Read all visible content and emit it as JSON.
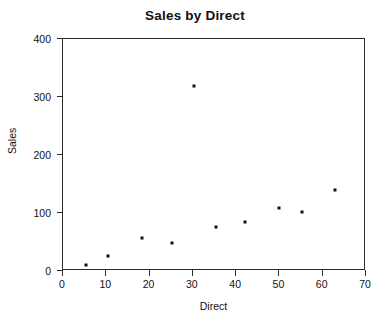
{
  "chart_data": {
    "type": "scatter",
    "title": "Sales by Direct",
    "xlabel": "Direct",
    "ylabel": "Sales",
    "xlim": [
      0,
      70
    ],
    "ylim": [
      0,
      400
    ],
    "xticks": [
      0,
      10,
      20,
      30,
      40,
      50,
      60,
      70
    ],
    "yticks": [
      0,
      100,
      200,
      300,
      400
    ],
    "xtick_labels": [
      "0",
      "10",
      "20",
      "30",
      "40",
      "50",
      "60",
      "70"
    ],
    "ytick_labels": [
      "0",
      "100",
      "200",
      "300",
      "400"
    ],
    "grid": false,
    "legend": false,
    "marker": "square",
    "marker_color": "#111111",
    "series": [
      {
        "name": "Sales",
        "points": [
          {
            "x": 5.5,
            "y": 9
          },
          {
            "x": 10.6,
            "y": 24
          },
          {
            "x": 18.5,
            "y": 55
          },
          {
            "x": 25.4,
            "y": 46
          },
          {
            "x": 30.5,
            "y": 317
          },
          {
            "x": 35.6,
            "y": 74
          },
          {
            "x": 42.3,
            "y": 83
          },
          {
            "x": 50.1,
            "y": 107
          },
          {
            "x": 55.4,
            "y": 100
          },
          {
            "x": 63.0,
            "y": 138
          }
        ]
      }
    ]
  }
}
